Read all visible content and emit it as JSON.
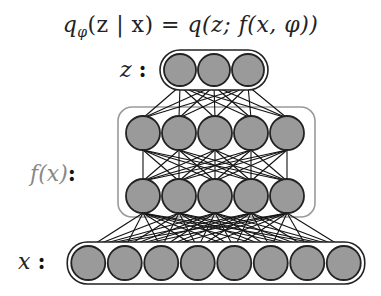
{
  "formula": {
    "lhs": "q",
    "lhs_sub": "φ",
    "lhs_args": "(z | x)",
    "eq": " = ",
    "rhs": "q(z; f(x, φ))"
  },
  "labels": {
    "z": "z",
    "fx": "f(x)",
    "x": "x",
    "colon": ":"
  },
  "layers": [
    {
      "name": "z",
      "nodes": 3
    },
    {
      "name": "f(x) hidden top",
      "nodes": 5
    },
    {
      "name": "f(x) hidden bottom",
      "nodes": 5
    },
    {
      "name": "x",
      "nodes": 8
    }
  ],
  "colors": {
    "node_fill": "#9a9a9a",
    "node_stroke": "#222222",
    "edge": "#111111",
    "fx_box": "#9a9a9a",
    "fx_label": "#888888"
  }
}
